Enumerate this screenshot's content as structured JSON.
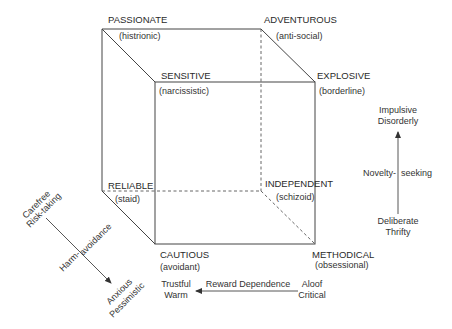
{
  "diagram": {
    "type": "personality-cube",
    "vertices": [
      {
        "id": "passionate",
        "label": "PASSIONATE",
        "sublabel": "(histrionic)"
      },
      {
        "id": "adventurous",
        "label": "ADVENTUROUS",
        "sublabel": "(anti-social)"
      },
      {
        "id": "sensitive",
        "label": "SENSITIVE",
        "sublabel": "(narcissistic)"
      },
      {
        "id": "explosive",
        "label": "EXPLOSIVE",
        "sublabel": "(borderline)"
      },
      {
        "id": "reliable",
        "label": "RELIABLE",
        "sublabel": "(staid)"
      },
      {
        "id": "independent",
        "label": "INDEPENDENT",
        "sublabel": "(schizoid)"
      },
      {
        "id": "cautious",
        "label": "CAUTIOUS",
        "sublabel": "(avoidant)"
      },
      {
        "id": "methodical",
        "label": "METHODICAL",
        "sublabel": "(obsessional)"
      }
    ],
    "axes": {
      "novelty_seeking": {
        "label_left": "Novelty-",
        "label_right": "seeking",
        "high_line1": "Impulsive",
        "high_line2": "Disorderly",
        "low_line1": "Deliberate",
        "low_line2": "Thrifty"
      },
      "harm_avoidance": {
        "label_left": "Harm-",
        "label_right": "avoidance",
        "low_line1": "Carefree",
        "low_line2": "Risk-taking",
        "high_line1": "Anxious",
        "high_line2": "Pessimistic"
      },
      "reward_dependence": {
        "label": "Reward Dependence",
        "high_line1": "Trustful",
        "high_line2": "Warm",
        "low_line1": "Aloof",
        "low_line2": "Critical"
      }
    }
  }
}
